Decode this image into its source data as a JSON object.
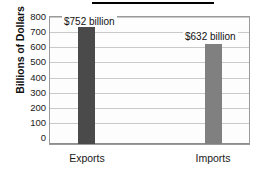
{
  "chart_data": {
    "type": "bar",
    "title": "U.S. Trade in Goods",
    "title_cropped": true,
    "categories": [
      "Exports",
      "Imports"
    ],
    "values": [
      752,
      632
    ],
    "data_labels": [
      "$752 billion",
      "$632 billion"
    ],
    "xlabel": "",
    "ylabel": "Billions of Dollars",
    "ylim": [
      0,
      800
    ],
    "ytick_labels": [
      "800",
      "700",
      "600",
      "500",
      "400",
      "300",
      "200",
      "100",
      "0"
    ],
    "ytick_values": [
      800,
      700,
      600,
      500,
      400,
      300,
      200,
      100,
      0
    ],
    "ytick_step": 100,
    "grid": true,
    "legend": "none",
    "series": [
      {
        "name": "Trade in Goods",
        "values": [
          752,
          632
        ],
        "colors": [
          "#4a4a4a",
          "#808080"
        ]
      }
    ],
    "colors": {
      "bar_exports": "#4a4a4a",
      "bar_imports": "#808080",
      "gridline": "#c9c9c9",
      "axis": "#8d8d8d",
      "plot_background": "#fdfdfd",
      "text": "#1a1a1a"
    }
  }
}
